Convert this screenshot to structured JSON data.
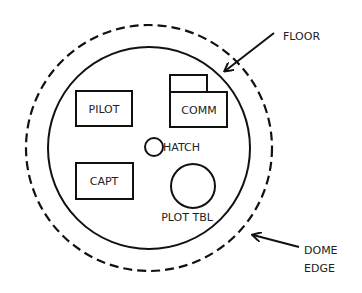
{
  "diagram": {
    "stations": {
      "pilot": "PILOT",
      "comm": "COMM",
      "hatch": "HATCH",
      "capt": "CAPT",
      "plot_table": "PLOT TBL"
    },
    "callouts": {
      "floor": "FLOOR",
      "dome_line1": "DOME",
      "dome_line2": "EDGE"
    },
    "colors": {
      "stroke": "#111111",
      "text": "#222222",
      "background": "#ffffff"
    }
  }
}
